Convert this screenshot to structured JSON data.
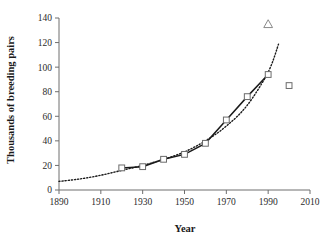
{
  "chart_data": {
    "type": "line",
    "title": "",
    "xlabel": "Year",
    "ylabel": "Thousands of breeding pairs",
    "xlim": [
      1890,
      2010
    ],
    "ylim": [
      0,
      140
    ],
    "xticks": [
      1890,
      1910,
      1930,
      1950,
      1970,
      1990,
      2010
    ],
    "xtick_labels": [
      "1890",
      "1910",
      "1930",
      "1950",
      "1970",
      "1990",
      "2010"
    ],
    "yticks": [
      0,
      20,
      40,
      60,
      80,
      100,
      120,
      140
    ],
    "ytick_labels": [
      "0",
      "20",
      "40",
      "60",
      "80",
      "100",
      "120",
      "140"
    ],
    "grid": false,
    "legend": "none",
    "series": [
      {
        "name": "Census counts",
        "style": "solid-line-open-square",
        "marker": "open-square",
        "x": [
          1920,
          1930,
          1940,
          1950,
          1960,
          1970,
          1980,
          1990
        ],
        "values": [
          18,
          19,
          25,
          29,
          38,
          57,
          76,
          94
        ]
      },
      {
        "name": "Fitted exponential trend",
        "style": "dotted-line",
        "marker": "none",
        "x": [
          1890,
          1900,
          1910,
          1920,
          1930,
          1940,
          1950,
          1960,
          1970,
          1980,
          1990,
          1995
        ],
        "values": [
          7,
          9,
          12,
          16,
          20,
          25,
          31,
          40,
          52,
          69,
          96,
          119
        ]
      },
      {
        "name": "Later single count",
        "style": "point-only",
        "marker": "open-square",
        "x": [
          2000
        ],
        "values": [
          85
        ]
      },
      {
        "name": "Alternative estimate",
        "style": "point-only",
        "marker": "open-triangle",
        "x": [
          1990
        ],
        "values": [
          135
        ]
      }
    ]
  }
}
